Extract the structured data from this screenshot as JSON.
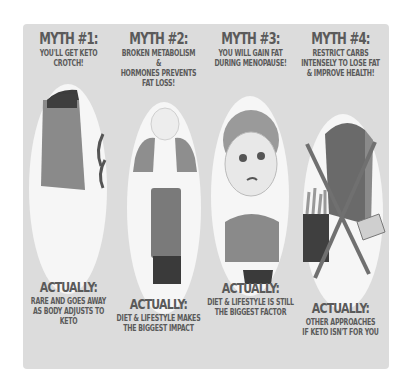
{
  "myths": [
    {
      "title": "MYTH #1:",
      "myth_line1": "YOU'LL GET KETO",
      "myth_line2": "CROTCH!",
      "actually_title": "ACTUALLY:",
      "actually_line1": "RARE AND GOES AWAY",
      "actually_line2": "AS BODY ADJUSTS TO KETO",
      "illustration": "woman-back-skirt-icon"
    },
    {
      "title": "MYTH #2:",
      "myth_line1": "BROKEN METABOLISM &",
      "myth_line2": "HORMONES PREVENTS",
      "myth_line3": "FAT LOSS!",
      "actually_title": "ACTUALLY:",
      "actually_line1": "DIET & LIFESTYLE MAKES",
      "actually_line2": "THE BIGGEST IMPACT",
      "illustration": "frustrated-woman-icon"
    },
    {
      "title": "MYTH #3:",
      "myth_line1": "YOU WILL GAIN FAT",
      "myth_line2": "DURING MENOPAUSE!",
      "actually_title": "ACTUALLY:",
      "actually_line1": "DIET & LIFESTYLE IS STILL",
      "actually_line2": "THE BIGGEST FACTOR",
      "illustration": "worried-older-woman-icon"
    },
    {
      "title": "MYTH #4:",
      "myth_line1": "RESTRICT CARBS",
      "myth_line2": "INTENSELY TO LOSE FAT",
      "myth_line3": "& IMPROVE HEALTH!",
      "actually_title": "ACTUALLY:",
      "actually_line1": "OTHER APPROACHES",
      "actually_line2": "IF KETO ISN'T FOR YOU",
      "illustration": "crossed-out-carbs-icon"
    }
  ],
  "colors": {
    "panel": "#dcdcdc",
    "text": "#5a5a5a",
    "oval": "#f6f6f6"
  }
}
